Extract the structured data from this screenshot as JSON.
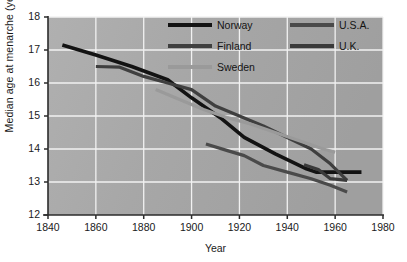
{
  "figure": {
    "axis_labels": {
      "x": "Year",
      "y": "Median age at menarche (years)"
    },
    "x_ticks": [
      "1840",
      "1860",
      "1880",
      "1900",
      "1920",
      "1940",
      "1960",
      "1980"
    ],
    "y_ticks": [
      "12",
      "13",
      "14",
      "15",
      "16",
      "17",
      "18"
    ],
    "background_color": "#a8a8a8",
    "grid_color": "#f2f2f2",
    "axis_color": "#2b2b2b",
    "page_background": "#ffffff"
  },
  "legend": {
    "position": "top-center-right",
    "entries": [
      {
        "label": "Norway",
        "color": "#131313",
        "width": 3.6,
        "col": 0,
        "row": 0
      },
      {
        "label": "Finland",
        "color": "#3f3f3f",
        "width": 3.2,
        "col": 0,
        "row": 1
      },
      {
        "label": "Sweden",
        "color": "#9a9a9a",
        "width": 3.2,
        "col": 0,
        "row": 2
      },
      {
        "label": "U.S.A.",
        "color": "#4a4a4a",
        "width": 3.2,
        "col": 1,
        "row": 0
      },
      {
        "label": "U.K.",
        "color": "#3a3a3a",
        "width": 3.2,
        "col": 1,
        "row": 1
      }
    ]
  },
  "chart_data": {
    "type": "line",
    "title": "",
    "xlabel": "Year",
    "ylabel": "Median age at menarche (years)",
    "xlim": [
      1840,
      1980
    ],
    "ylim": [
      12,
      18
    ],
    "xticks": [
      1840,
      1860,
      1880,
      1900,
      1920,
      1940,
      1960,
      1980
    ],
    "yticks": [
      12,
      13,
      14,
      15,
      16,
      17,
      18
    ],
    "grid": true,
    "legend_position": "upper center",
    "series": [
      {
        "name": "Norway",
        "color": "#131313",
        "linewidth": 3.6,
        "x": [
          1846,
          1860,
          1875,
          1890,
          1900,
          1912,
          1922,
          1935,
          1948,
          1952,
          1960,
          1971
        ],
        "y": [
          17.15,
          16.85,
          16.5,
          16.1,
          15.55,
          14.95,
          14.35,
          13.85,
          13.4,
          13.3,
          13.3,
          13.3
        ]
      },
      {
        "name": "Finland",
        "color": "#3f3f3f",
        "linewidth": 3.2,
        "x": [
          1860,
          1870,
          1880,
          1890,
          1900,
          1910,
          1920,
          1930,
          1940,
          1950,
          1958,
          1965
        ],
        "y": [
          16.5,
          16.48,
          16.2,
          16.0,
          15.8,
          15.3,
          15.0,
          14.7,
          14.35,
          14.0,
          13.55,
          13.05
        ]
      },
      {
        "name": "Sweden",
        "color": "#9a9a9a",
        "linewidth": 3.2,
        "x": [
          1885,
          1895,
          1905,
          1915,
          1925,
          1935,
          1945,
          1955,
          1960
        ],
        "y": [
          15.8,
          15.5,
          15.2,
          14.95,
          14.75,
          14.5,
          14.25,
          14.0,
          13.9
        ]
      },
      {
        "name": "U.S.A.",
        "color": "#4a4a4a",
        "linewidth": 3.2,
        "x": [
          1906,
          1915,
          1922,
          1930,
          1940,
          1950,
          1958,
          1965
        ],
        "y": [
          14.15,
          13.95,
          13.8,
          13.5,
          13.3,
          13.1,
          12.9,
          12.7
        ]
      },
      {
        "name": "U.K.",
        "color": "#3a3a3a",
        "linewidth": 3.2,
        "x": [
          1947,
          1953,
          1958,
          1965
        ],
        "y": [
          13.52,
          13.38,
          13.1,
          13.05
        ]
      }
    ]
  }
}
